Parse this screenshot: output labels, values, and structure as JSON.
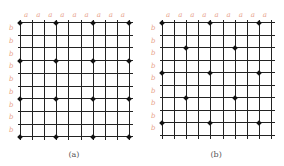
{
  "panels": [
    {
      "caption": "(a)",
      "grid_cols": 10,
      "grid_rows": 10,
      "col_label": "a",
      "row_label": "b",
      "origin": [
        20,
        22
      ],
      "spacing": [
        12.1,
        12.7
      ],
      "dots": [
        [
          0,
          0
        ],
        [
          3,
          0
        ],
        [
          6,
          0
        ],
        [
          9,
          0
        ],
        [
          0,
          3
        ],
        [
          3,
          3
        ],
        [
          6,
          3
        ],
        [
          9,
          3
        ],
        [
          0,
          6
        ],
        [
          3,
          6
        ],
        [
          6,
          6
        ],
        [
          9,
          6
        ],
        [
          0,
          9
        ],
        [
          3,
          9
        ],
        [
          6,
          9
        ],
        [
          9,
          9
        ]
      ]
    },
    {
      "caption": "(b)",
      "grid_cols": 10,
      "grid_rows": 10,
      "col_label": "a",
      "row_label": "b",
      "origin": [
        162,
        22
      ],
      "spacing": [
        12.1,
        12.5
      ],
      "dots": [
        [
          0,
          0
        ],
        [
          4,
          0
        ],
        [
          8,
          0
        ],
        [
          2,
          2
        ],
        [
          6,
          2
        ],
        [
          0,
          4
        ],
        [
          4,
          4
        ],
        [
          8,
          4
        ],
        [
          2,
          6
        ],
        [
          6,
          6
        ],
        [
          0,
          8
        ],
        [
          4,
          8
        ],
        [
          8,
          8
        ]
      ]
    }
  ],
  "colors": {
    "line": "#222222",
    "label": "#e8a48c",
    "dot": "#111111"
  }
}
